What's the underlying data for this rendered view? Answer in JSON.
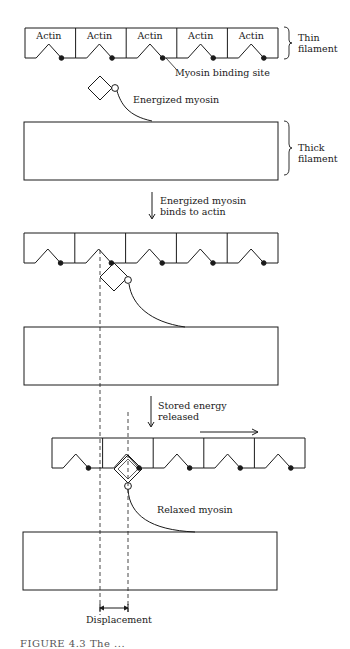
{
  "colors": {
    "stroke": "#1a1a1a",
    "background": "#ffffff",
    "text": "#1a1a1a"
  },
  "stage1": {
    "actin_labels": [
      "Actin",
      "Actin",
      "Actin",
      "Actin",
      "Actin"
    ],
    "thin_filament_label_line1": "Thin",
    "thin_filament_label_line2": "filament",
    "binding_site_label": "Myosin binding site",
    "myosin_label": "Energized myosin",
    "thick_filament_label_line1": "Thick",
    "thick_filament_label_line2": "filament"
  },
  "step1": {
    "line1": "Energized myosin",
    "line2": "binds to actin"
  },
  "step2": {
    "line1": "Stored energy",
    "line2": "released"
  },
  "stage3": {
    "myosin_label": "Relaxed myosin"
  },
  "displacement_label": "Displacement",
  "caption_partial": "FIGURE 4.3  The ...",
  "geometry": {
    "thin_filaments": [
      {
        "x": 25,
        "y": 28,
        "w": 253,
        "h": 30,
        "cells": 5
      },
      {
        "x": 24,
        "y": 233,
        "w": 254,
        "h": 30,
        "cells": 5
      },
      {
        "x": 52,
        "y": 438,
        "w": 253,
        "h": 30,
        "cells": 5
      }
    ],
    "thick_filaments": [
      {
        "x": 24,
        "y": 122,
        "w": 254,
        "h": 58
      },
      {
        "x": 24,
        "y": 327,
        "w": 254,
        "h": 58
      },
      {
        "x": 23,
        "y": 532,
        "w": 254,
        "h": 58
      }
    ],
    "dashed_lines": [
      {
        "x": 100,
        "y1": 250,
        "y2": 615
      },
      {
        "x": 128,
        "y1": 412,
        "y2": 612
      }
    ],
    "displacement_bracket": {
      "x1": 100,
      "x2": 128,
      "y": 608
    }
  }
}
